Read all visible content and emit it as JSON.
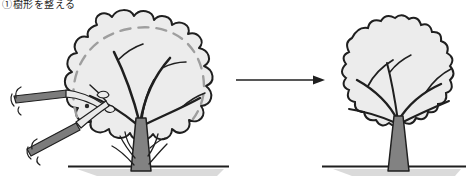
{
  "caption": {
    "text": "①樹形を整える"
  },
  "colors": {
    "background": "#ffffff",
    "outline": "#1f1f1f",
    "canopy_fill": "#ececec",
    "trunk_fill": "#828282",
    "dashed_guide": "#9e9e9e",
    "ground_shadow": "#dadada",
    "shear_handle": "#7c7c7c",
    "shear_blade": "#e9e9e9",
    "pivot": "#2a2a2a"
  },
  "elements": {
    "before_tree": "unpruned-tree",
    "after_tree": "pruned-tree",
    "tool": "hedge-shears-icon",
    "transform": "right-arrow",
    "target_shape": "dashed-pruning-guide"
  }
}
